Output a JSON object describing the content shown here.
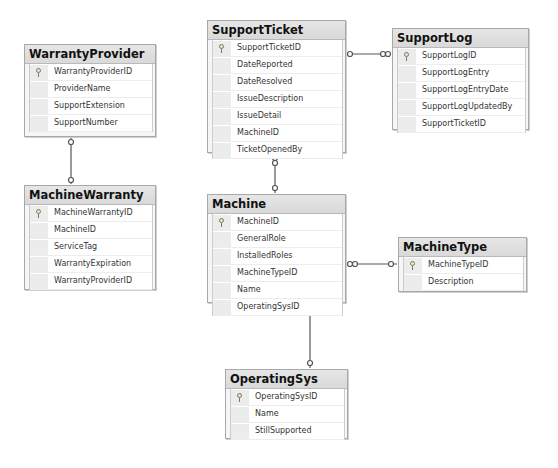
{
  "tables": {
    "warranty_provider": {
      "title": "WarrantyProvider",
      "columns": [
        {
          "name": "WarrantyProviderID",
          "pk": true
        },
        {
          "name": "ProviderName",
          "pk": false
        },
        {
          "name": "SupportExtension",
          "pk": false
        },
        {
          "name": "SupportNumber",
          "pk": false
        }
      ]
    },
    "machine_warranty": {
      "title": "MachineWarranty",
      "columns": [
        {
          "name": "MachineWarrantyID",
          "pk": true
        },
        {
          "name": "MachineID",
          "pk": false
        },
        {
          "name": "ServiceTag",
          "pk": false
        },
        {
          "name": "WarrantyExpiration",
          "pk": false
        },
        {
          "name": "WarrantyProviderID",
          "pk": false
        }
      ]
    },
    "support_ticket": {
      "title": "SupportTicket",
      "columns": [
        {
          "name": "SupportTicketID",
          "pk": true
        },
        {
          "name": "DateReported",
          "pk": false
        },
        {
          "name": "DateResolved",
          "pk": false
        },
        {
          "name": "IssueDescription",
          "pk": false
        },
        {
          "name": "IssueDetail",
          "pk": false
        },
        {
          "name": "MachineID",
          "pk": false
        },
        {
          "name": "TicketOpenedBy",
          "pk": false
        }
      ]
    },
    "support_log": {
      "title": "SupportLog",
      "columns": [
        {
          "name": "SupportLogID",
          "pk": true
        },
        {
          "name": "SupportLogEntry",
          "pk": false
        },
        {
          "name": "SupportLogEntryDate",
          "pk": false
        },
        {
          "name": "SupportLogUpdatedBy",
          "pk": false
        },
        {
          "name": "SupportTicketID",
          "pk": false
        }
      ]
    },
    "machine": {
      "title": "Machine",
      "columns": [
        {
          "name": "MachineID",
          "pk": true
        },
        {
          "name": "GeneralRole",
          "pk": false
        },
        {
          "name": "InstalledRoles",
          "pk": false
        },
        {
          "name": "MachineTypeID",
          "pk": false
        },
        {
          "name": "Name",
          "pk": false
        },
        {
          "name": "OperatingSysID",
          "pk": false
        }
      ]
    },
    "machine_type": {
      "title": "MachineType",
      "columns": [
        {
          "name": "MachineTypeID",
          "pk": true
        },
        {
          "name": "Description",
          "pk": false
        }
      ]
    },
    "operating_sys": {
      "title": "OperatingSys",
      "columns": [
        {
          "name": "OperatingSysID",
          "pk": true
        },
        {
          "name": "Name",
          "pk": false
        },
        {
          "name": "StillSupported",
          "pk": false
        }
      ]
    }
  },
  "relationships": [
    {
      "from": "WarrantyProvider",
      "to": "MachineWarranty"
    },
    {
      "from": "SupportTicket",
      "to": "SupportLog"
    },
    {
      "from": "SupportTicket",
      "to": "Machine"
    },
    {
      "from": "Machine",
      "to": "MachineType"
    },
    {
      "from": "Machine",
      "to": "OperatingSys"
    }
  ],
  "colors": {
    "header_bg": "#dddddd",
    "border": "#a8a8a8",
    "line": "#555555"
  }
}
